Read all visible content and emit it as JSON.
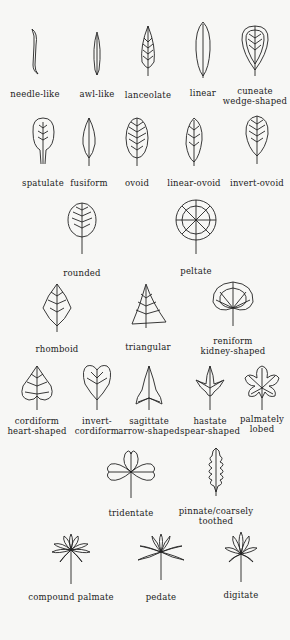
{
  "leaves": [
    {
      "id": "needle-like",
      "lines": [
        "needle-like"
      ]
    },
    {
      "id": "awl-like",
      "lines": [
        "awl-like"
      ]
    },
    {
      "id": "lanceolate",
      "lines": [
        "lanceolate"
      ]
    },
    {
      "id": "linear",
      "lines": [
        "linear"
      ]
    },
    {
      "id": "cuneate",
      "lines": [
        "cuneate",
        "wedge-shaped"
      ]
    },
    {
      "id": "spatulate",
      "lines": [
        "spatulate"
      ]
    },
    {
      "id": "fusiform",
      "lines": [
        "fusiform"
      ]
    },
    {
      "id": "ovoid",
      "lines": [
        "ovoid"
      ]
    },
    {
      "id": "linear-ovoid",
      "lines": [
        "linear-ovoid"
      ]
    },
    {
      "id": "invert-ovoid",
      "lines": [
        "invert-ovoid"
      ]
    },
    {
      "id": "rounded",
      "lines": [
        "rounded"
      ]
    },
    {
      "id": "peltate",
      "lines": [
        "peltate"
      ]
    },
    {
      "id": "rhomboid",
      "lines": [
        "rhomboid"
      ]
    },
    {
      "id": "triangular",
      "lines": [
        "triangular"
      ]
    },
    {
      "id": "reniform",
      "lines": [
        "reniform",
        "kidney-shaped"
      ]
    },
    {
      "id": "cordiform",
      "lines": [
        "cordiform",
        "heart-shaped"
      ]
    },
    {
      "id": "invert-cordiform",
      "lines": [
        "invert-",
        "cordiform"
      ]
    },
    {
      "id": "sagittate",
      "lines": [
        "sagittate",
        "arrow-shaped"
      ]
    },
    {
      "id": "hastate",
      "lines": [
        "hastate",
        "spear-shaped"
      ]
    },
    {
      "id": "palmately-lobed",
      "lines": [
        "palmately",
        "lobed"
      ]
    },
    {
      "id": "tridentate",
      "lines": [
        "tridentate"
      ]
    },
    {
      "id": "pinnate",
      "lines": [
        "pinnate/coarsely",
        "toothed"
      ]
    },
    {
      "id": "compound-palmate",
      "lines": [
        "compound palmate"
      ]
    },
    {
      "id": "pedate",
      "lines": [
        "pedate"
      ]
    },
    {
      "id": "digitate",
      "lines": [
        "digitate"
      ]
    }
  ]
}
